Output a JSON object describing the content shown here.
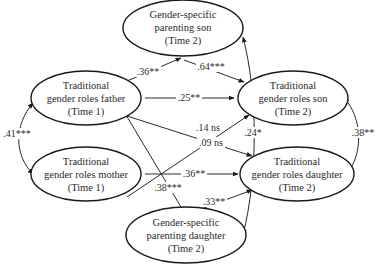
{
  "nodes": {
    "gs_son": {
      "lines": [
        "Gender-specific",
        "parenting son",
        "(Time 2)"
      ]
    },
    "father": {
      "lines": [
        "Traditional",
        "gender roles father",
        "(Time 1)"
      ]
    },
    "son": {
      "lines": [
        "Traditional",
        "gender roles son",
        "(Time 2)"
      ]
    },
    "mother": {
      "lines": [
        "Traditional",
        "gender roles mother",
        "(Time 1)"
      ]
    },
    "daughter": {
      "lines": [
        "Traditional",
        "gender roles daughter",
        "(Time 2)"
      ]
    },
    "gs_daughter": {
      "lines": [
        "Gender-specific",
        "parenting daughter",
        "(Time 2)"
      ]
    }
  },
  "edges": {
    "father_gs_son": ".36**",
    "gs_son_son": ".64***",
    "father_son": ".25**",
    "mother_son": ".14 ns",
    "father_daughter": ".09 ns",
    "mother_daughter": ".36**",
    "father_gs_daughter": ".38***",
    "gs_daughter_daughter": ".33**",
    "gs_son_gs_daughter": ".24*",
    "father_mother": ".41***",
    "son_daughter": ".38**"
  },
  "colors": {
    "stroke": "#1a1a1a",
    "text": "#2a2a2a",
    "background": "#ffffff"
  }
}
